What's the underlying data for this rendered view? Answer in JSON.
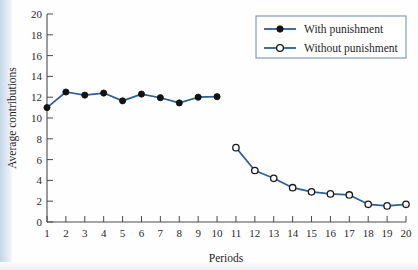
{
  "chart_data": {
    "type": "line",
    "title": "",
    "xlabel": "Periods",
    "ylabel": "Average contributions",
    "xlim": [
      1,
      20
    ],
    "ylim": [
      0,
      20
    ],
    "ytick_step": 2,
    "grid": false,
    "legend_position": "top-right",
    "x": [
      1,
      2,
      3,
      4,
      5,
      6,
      7,
      8,
      9,
      10,
      11,
      12,
      13,
      14,
      15,
      16,
      17,
      18,
      19,
      20
    ],
    "xticklabels": [
      "1",
      "2",
      "3",
      "4",
      "5",
      "6",
      "7",
      "8",
      "9",
      "10",
      "11",
      "12",
      "13",
      "14",
      "15",
      "16",
      "17",
      "18",
      "19",
      "20"
    ],
    "yticklabels": [
      "0",
      "2",
      "4",
      "6",
      "8",
      "10",
      "12",
      "14",
      "16",
      "18",
      "20"
    ],
    "series": [
      {
        "name": "With punishment",
        "marker": "filled-circle",
        "color": "#2e5f95",
        "x": [
          1,
          2,
          3,
          4,
          5,
          6,
          7,
          8,
          9,
          10
        ],
        "values": [
          11.0,
          12.5,
          12.2,
          12.4,
          11.65,
          12.3,
          11.95,
          11.45,
          12.0,
          12.05
        ]
      },
      {
        "name": "Without punishment",
        "marker": "open-circle",
        "color": "#2e5f95",
        "x": [
          11,
          12,
          13,
          14,
          15,
          16,
          17,
          18,
          19,
          20
        ],
        "values": [
          7.15,
          4.95,
          4.2,
          3.3,
          2.9,
          2.7,
          2.6,
          1.7,
          1.55,
          1.7
        ]
      }
    ]
  },
  "legend": {
    "entries": [
      {
        "label": "With punishment",
        "marker": "filled-circle"
      },
      {
        "label": "Without punishment",
        "marker": "open-circle"
      }
    ]
  },
  "colors": {
    "line": "#2e5f95",
    "axis": "#4a4a4a",
    "page_background": "#cddcea",
    "plot_background": "#ffffff"
  }
}
